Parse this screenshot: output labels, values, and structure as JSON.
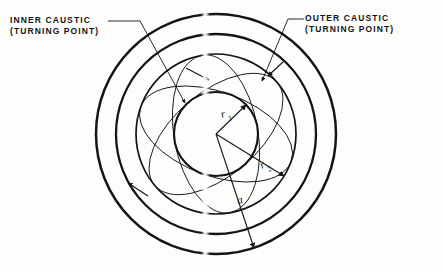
{
  "figure": {
    "background_color": "#fdfdfb",
    "ink_color": "#141414"
  },
  "labels": {
    "inner_caustic": {
      "line1": "INNER CAUSTIC",
      "line2": "(TURNING POINT)"
    },
    "outer_caustic": {
      "line1": "OUTER CAUSTIC",
      "line2": "(TURNING POINT)"
    }
  },
  "dimensions": {
    "r1": {
      "symbol": "r",
      "subscript": "1",
      "meaning": "inner caustic radius"
    },
    "r2": {
      "symbol": "r",
      "subscript": "2",
      "meaning": "outer caustic radius"
    },
    "a": {
      "symbol": "a",
      "subscript": "",
      "meaning": "shell radius"
    }
  },
  "geometry": {
    "center": {
      "x": 216,
      "y": 134
    },
    "shell_outer_radius": 120,
    "shell_inner_radius": 100,
    "outer_caustic_radius": 80,
    "inner_caustic_radius": 42,
    "orbit_lobes": 3,
    "orbit_precession_deg": 120
  },
  "leaders": {
    "inner_caustic_leader": "from text right edge to inner caustic circle",
    "outer_caustic_leader": "from text left edge to outer caustic circle"
  }
}
